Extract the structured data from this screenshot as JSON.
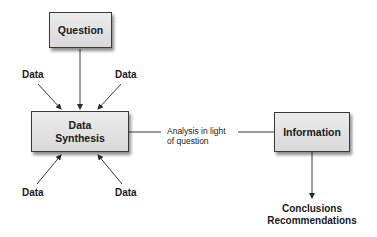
{
  "diagram": {
    "nodes": {
      "question": {
        "label": "Question"
      },
      "synthesis": {
        "label_line1": "Data",
        "label_line2": "Synthesis"
      },
      "information": {
        "label": "Information"
      }
    },
    "data_inputs": [
      "Data",
      "Data",
      "Data",
      "Data"
    ],
    "edge_label": {
      "line1": "Analysis in light",
      "line2": "of question"
    },
    "outputs": {
      "line1": "Conclusions",
      "line2": "Recommendations"
    },
    "colors": {
      "box_fill": "#e0e0e0",
      "stroke": "#3a3a3a",
      "text": "#1a1a1a"
    }
  }
}
